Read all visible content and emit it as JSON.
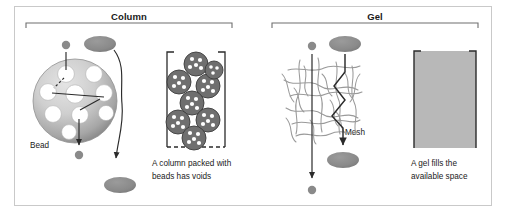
{
  "figure": {
    "background_color": "#ffffff",
    "border_color": "#c9c9c9"
  },
  "colors": {
    "bead_fill_light": "#d8d8d8",
    "bead_fill_dark": "#8c8c8c",
    "particle_gray": "#8a8a8a",
    "mesh_gray": "#9a9a9a",
    "gel_fill": "#b8b8b8",
    "outline_dark": "#2b2b2b",
    "bracket_gray": "#6e6e6e",
    "text_dark": "#1a1a1a"
  },
  "panels": [
    {
      "id": "column",
      "title": "Column",
      "bead_label": "Bead",
      "caption": "A column packed with\nbeads has voids",
      "packed_bead_count": 8,
      "bead_pore_count": 9
    },
    {
      "id": "gel",
      "title": "Gel",
      "mesh_label": "Mesh",
      "caption": "A gel fills the\navailable space"
    }
  ],
  "particles": {
    "small_label": "small molecule",
    "large_label": "large molecule"
  }
}
